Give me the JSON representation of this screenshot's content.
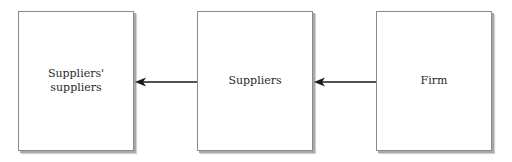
{
  "diagram": {
    "type": "flow",
    "direction": "right-to-left",
    "nodes": [
      {
        "id": "suppliers_suppliers",
        "label": "Suppliers'\nsuppliers"
      },
      {
        "id": "suppliers",
        "label": "Suppliers"
      },
      {
        "id": "firm",
        "label": "Firm"
      }
    ],
    "edges": [
      {
        "from": "firm",
        "to": "suppliers"
      },
      {
        "from": "suppliers",
        "to": "suppliers_suppliers"
      }
    ]
  },
  "colors": {
    "line": "#1a1a1a",
    "box_border": "#8a8a8a",
    "shadow": "#a8a8a8",
    "text": "#2a2a2a"
  }
}
